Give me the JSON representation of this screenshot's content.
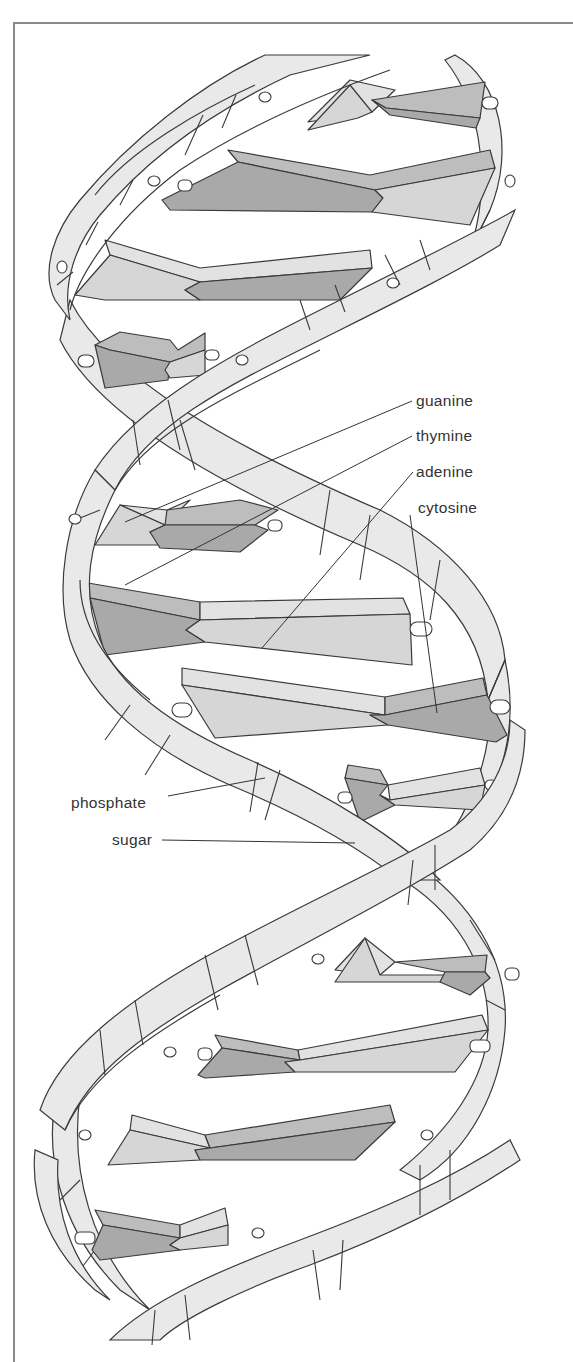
{
  "figure": {
    "colors": {
      "frame": "#8a8a8a",
      "backbone": "#e9e9e9",
      "base_dark": "#a9a9a9",
      "base_light": "#d6d6d6",
      "outline": "#3a3a3a",
      "label_text": "#333333"
    }
  },
  "labels": {
    "guanine": "guanine",
    "thymine": "thymine",
    "adenine": "adenine",
    "cytosine": "cytosine",
    "phosphate": "phosphate",
    "sugar": "sugar"
  }
}
